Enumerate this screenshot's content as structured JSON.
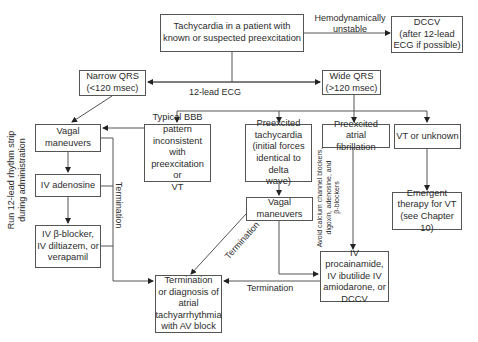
{
  "diagram": {
    "nodes": {
      "start": "Tachycardia in a patient with\nknown or suspected preexcitation",
      "dccv": "DCCV\n(after 12-lead\nECG if possible)",
      "narrow_qrs": "Narrow QRS\n(<120 msec)",
      "wide_qrs": "Wide QRS\n(>120 msec)",
      "vagal_left": "Vagal\nmaneuvers",
      "iv_adenosine": "IV adenosine",
      "iv_beta_blocker": "IV β-blocker,\nIV diltiazem, or\nverapamil",
      "typical_bbb": "Typical BBB\npattern\ninconsistent with\npreexcitation or\nVT",
      "preexcited_tachy": "Preexcited\ntachycardia\n(initial forces\nidentical to delta\nwave)",
      "vagal_middle": "Vagal\nmaneuvers",
      "preexcited_af": "Preexcited atrial\nfibrillation",
      "vt_unknown": "VT or unknown",
      "emergent_vt": "Emergent\ntherapy for VT\n(see Chapter 10)",
      "procainamide": "IV procainamide,\nIV ibutilide IV\namiodarone, or\nDCCV",
      "termination": "Termination\nor diagnosis of\natrial\ntachyarrhythmia\nwith AV block"
    },
    "edge_labels": {
      "unstable": "Hemodynamically\nunstable",
      "ecg": "12-lead ECG",
      "termination_vertical": "Termination",
      "termination_diagonal": "Termination",
      "termination_horizontal": "Termination",
      "run_strip": "Run 12-lead rhythm strip\nduring administration",
      "avoid": "Avoid calcium channel blockers,\ndigoxin, adenosine, and\nβ-blockers"
    },
    "colors": {
      "line": "#444444",
      "text": "#2b2b2b",
      "background": "#ffffff"
    }
  }
}
